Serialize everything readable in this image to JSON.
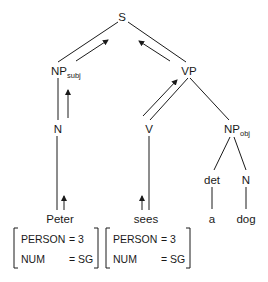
{
  "diagram": {
    "type": "syntax-tree",
    "nodes": {
      "S": {
        "label": "S"
      },
      "NP_subj": {
        "label": "NP",
        "subscript": "subj"
      },
      "VP": {
        "label": "VP"
      },
      "N_subj": {
        "label": "N"
      },
      "V": {
        "label": "V"
      },
      "NP_obj": {
        "label": "NP",
        "subscript": "obj"
      },
      "det": {
        "label": "det"
      },
      "N_obj": {
        "label": "N"
      }
    },
    "leaves": {
      "peter": "Peter",
      "sees": "sees",
      "a": "a",
      "dog": "dog"
    },
    "edges": [
      [
        "S",
        "NP_subj"
      ],
      [
        "S",
        "VP"
      ],
      [
        "NP_subj",
        "N_subj"
      ],
      [
        "VP",
        "V"
      ],
      [
        "VP",
        "NP_obj"
      ],
      [
        "NP_obj",
        "det"
      ],
      [
        "NP_obj",
        "N_obj"
      ],
      [
        "N_subj",
        "peter"
      ],
      [
        "V",
        "sees"
      ],
      [
        "det",
        "a"
      ],
      [
        "N_obj",
        "dog"
      ]
    ],
    "feature_flow_arrows": [
      [
        "peter",
        "N_subj"
      ],
      [
        "N_subj",
        "NP_subj"
      ],
      [
        "NP_subj",
        "S"
      ],
      [
        "sees",
        "V"
      ],
      [
        "V",
        "VP"
      ],
      [
        "VP",
        "S"
      ]
    ],
    "feature_structures": [
      {
        "word": "Peter",
        "features": [
          {
            "attr": "PERSON",
            "eq": "=",
            "value": "3"
          },
          {
            "attr": "NUM",
            "eq": "=",
            "value": "SG"
          }
        ]
      },
      {
        "word": "sees",
        "features": [
          {
            "attr": "PERSON",
            "eq": "=",
            "value": "3"
          },
          {
            "attr": "NUM",
            "eq": "=",
            "value": "SG"
          }
        ]
      }
    ],
    "colors": {
      "ink": "#1a1a1a",
      "background": "#ffffff"
    }
  }
}
